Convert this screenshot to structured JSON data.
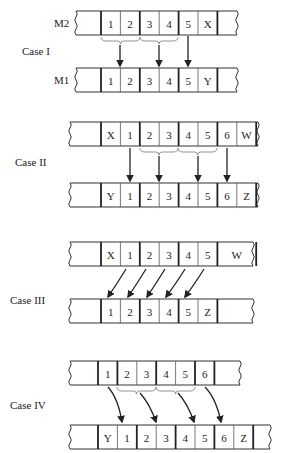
{
  "diagram": {
    "cases": [
      {
        "label": "Case I",
        "label_pos": [
          22,
          55
        ],
        "strips": [
          {
            "name": "M2",
            "label": "M2",
            "y": 11,
            "x_start": 76,
            "x_end": 237,
            "first_bound": 101,
            "cells": [
              "1",
              "2",
              "3",
              "4",
              "5",
              "X"
            ],
            "widths": [
              1,
              1,
              1,
              1,
              1,
              1
            ],
            "thick_after": [
              2,
              4,
              6
            ],
            "right_pad": true
          },
          {
            "name": "M1",
            "label": "M1",
            "y": 68,
            "x_start": 76,
            "x_end": 237,
            "first_bound": 101,
            "cells": [
              "1",
              "2",
              "3",
              "4",
              "5",
              "Y"
            ],
            "widths": [
              1,
              1,
              1,
              1,
              1,
              1
            ],
            "thick_after": [
              2,
              4,
              6
            ],
            "right_pad": true
          }
        ],
        "braces": [
          [
            101,
            140
          ],
          [
            140,
            178
          ]
        ],
        "arrows": [
          {
            "type": "straight",
            "x1": 120,
            "y1": 45,
            "x2": 120,
            "y2": 66
          },
          {
            "type": "straight",
            "x1": 159,
            "y1": 45,
            "x2": 159,
            "y2": 66
          },
          {
            "type": "straight",
            "x1": 188,
            "y1": 36,
            "x2": 188,
            "y2": 66
          }
        ]
      },
      {
        "label": "Case II",
        "label_pos": [
          15,
          166
        ],
        "strips": [
          {
            "name": "top",
            "label": "",
            "y": 122,
            "x_start": 70,
            "x_end": 258,
            "first_bound": 101,
            "cells": [
              "X",
              "1",
              "2",
              "3",
              "4",
              "5",
              "6",
              "W"
            ],
            "widths": [
              1,
              1,
              1,
              1,
              1,
              1,
              1,
              1
            ],
            "thick_after": [
              2,
              4,
              6,
              8
            ],
            "right_pad": true
          },
          {
            "name": "bottom",
            "label": "",
            "y": 183,
            "x_start": 70,
            "x_end": 258,
            "first_bound": 101,
            "cells": [
              "Y",
              "1",
              "2",
              "3",
              "4",
              "5",
              "6",
              "Z"
            ],
            "widths": [
              1,
              1,
              1,
              1,
              1,
              1,
              1,
              1
            ],
            "thick_after": [
              2,
              4,
              6,
              8
            ],
            "right_pad": true
          }
        ],
        "braces": [
          [
            140,
            178
          ],
          [
            178,
            217
          ]
        ],
        "arrows": [
          {
            "type": "straight",
            "x1": 130,
            "y1": 148,
            "x2": 130,
            "y2": 181
          },
          {
            "type": "straight",
            "x1": 159,
            "y1": 156,
            "x2": 159,
            "y2": 181
          },
          {
            "type": "straight",
            "x1": 198,
            "y1": 156,
            "x2": 198,
            "y2": 181
          },
          {
            "type": "straight",
            "x1": 227,
            "y1": 148,
            "x2": 227,
            "y2": 181
          }
        ]
      },
      {
        "label": "Case III",
        "label_pos": [
          10,
          304
        ],
        "strips": [
          {
            "name": "top",
            "label": "",
            "y": 242,
            "x_start": 70,
            "x_end": 253,
            "first_bound": 101,
            "cells": [
              "X",
              "1",
              "2",
              "3",
              "4",
              "5",
              "W"
            ],
            "widths": [
              1,
              1,
              1,
              1,
              1,
              1,
              2
            ],
            "thick_after": [
              2,
              4,
              6,
              7
            ],
            "right_pad": true
          },
          {
            "name": "bottom",
            "label": "",
            "y": 299,
            "x_start": 70,
            "x_end": 253,
            "first_bound": 101,
            "cells": [
              "1",
              "2",
              "3",
              "4",
              "5",
              "Z"
            ],
            "widths": [
              1,
              1,
              1,
              1,
              1,
              1
            ],
            "thick_after": [
              2,
              4,
              6
            ],
            "right_pad": true
          }
        ],
        "braces": [],
        "arrows": [
          {
            "type": "curve",
            "x1": 126,
            "y1": 269,
            "cx": 118,
            "cy": 282,
            "x2": 108,
            "y2": 297
          },
          {
            "type": "curve",
            "x1": 146,
            "y1": 269,
            "cx": 138,
            "cy": 282,
            "x2": 128,
            "y2": 297
          },
          {
            "type": "curve",
            "x1": 165,
            "y1": 269,
            "cx": 157,
            "cy": 282,
            "x2": 147,
            "y2": 297
          },
          {
            "type": "curve",
            "x1": 185,
            "y1": 269,
            "cx": 177,
            "cy": 282,
            "x2": 166,
            "y2": 297
          },
          {
            "type": "curve",
            "x1": 204,
            "y1": 269,
            "cx": 196,
            "cy": 282,
            "x2": 185,
            "y2": 297
          }
        ]
      },
      {
        "label": "Case IV",
        "label_pos": [
          10,
          409
        ],
        "strips": [
          {
            "name": "top",
            "label": "",
            "y": 361,
            "x_start": 70,
            "x_end": 240,
            "first_bound": 98,
            "cells": [
              "1",
              "2",
              "3",
              "4",
              "5",
              "6"
            ],
            "widths": [
              1,
              1,
              1,
              1,
              1,
              1
            ],
            "thick_after": [
              1,
              3,
              5,
              6
            ],
            "right_pad": true
          },
          {
            "name": "bottom",
            "label": "",
            "y": 425,
            "x_start": 70,
            "x_end": 270,
            "first_bound": 98,
            "cells": [
              "Y",
              "1",
              "2",
              "3",
              "4",
              "5",
              "6",
              "Z"
            ],
            "widths": [
              1,
              1,
              1,
              1,
              1,
              1,
              1,
              1
            ],
            "thick_after": [
              2,
              4,
              6,
              8
            ],
            "right_pad": true
          }
        ],
        "braces": [
          [
            117,
            156
          ],
          [
            156,
            195
          ]
        ],
        "arrows": [
          {
            "type": "curve",
            "x1": 108,
            "y1": 387,
            "cx": 118,
            "cy": 398,
            "x2": 122,
            "y2": 422
          },
          {
            "type": "curve",
            "x1": 140,
            "y1": 393,
            "cx": 150,
            "cy": 404,
            "x2": 156,
            "y2": 422
          },
          {
            "type": "curve",
            "x1": 178,
            "y1": 393,
            "cx": 188,
            "cy": 404,
            "x2": 194,
            "y2": 422
          },
          {
            "type": "curve",
            "x1": 205,
            "y1": 387,
            "cx": 216,
            "cy": 398,
            "x2": 221,
            "y2": 422
          }
        ]
      }
    ],
    "cell_width": 19.4,
    "strip_height": 24,
    "colors": {
      "line": "#222222",
      "thin": "#555555",
      "brace": "#777777",
      "background": "#ffffff"
    }
  }
}
